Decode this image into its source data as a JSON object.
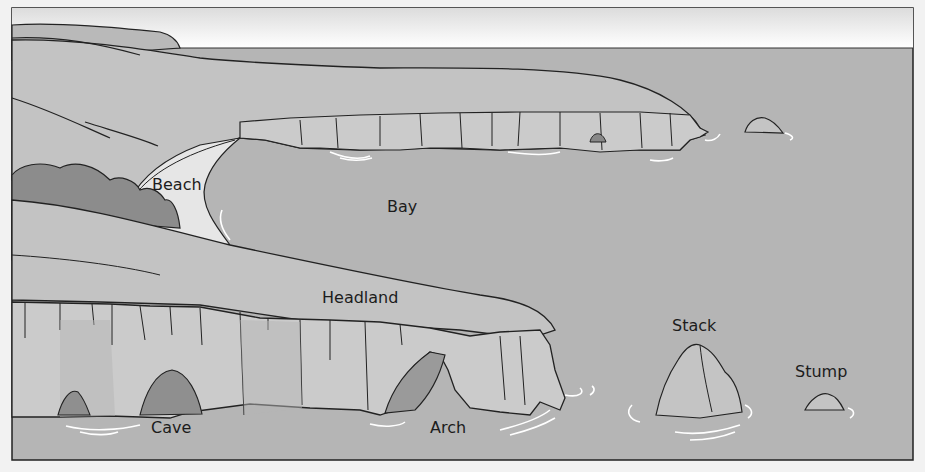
{
  "diagram": {
    "type": "coastal-landforms-illustration",
    "labels": {
      "beach": "Beach",
      "bay": "Bay",
      "headland": "Headland",
      "stack": "Stack",
      "stump": "Stump",
      "cave": "Cave",
      "arch": "Arch"
    },
    "colors": {
      "sea": "#b3b3b3",
      "land": "#c2c2c2",
      "cliff_face": "#c9c9c9",
      "cliff_shadow": "#a9a9a9",
      "vegetation": "#8a8a8a",
      "beach": "#e4e4e4",
      "sky": "#fbfbfb",
      "outline": "#222222",
      "wave": "#ffffff"
    }
  }
}
